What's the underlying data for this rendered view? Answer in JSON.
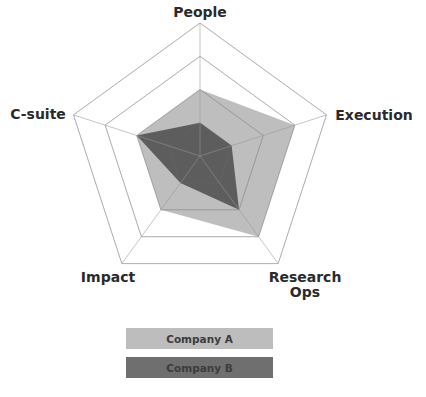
{
  "chart_data": {
    "type": "radar",
    "title": "",
    "axes": [
      "People",
      "Execution",
      "Research Ops",
      "Impact",
      "C-suite"
    ],
    "range": [
      0,
      4
    ],
    "grid_levels": [
      1,
      2,
      3,
      4
    ],
    "series": [
      {
        "name": "Company A",
        "values": [
          2,
          3,
          3,
          2,
          2
        ],
        "color": "#a9a9a9"
      },
      {
        "name": "Company B",
        "values": [
          1,
          1,
          2,
          1,
          2
        ],
        "color": "#4a4a4a"
      }
    ],
    "legend_position": "bottom"
  },
  "labels": {
    "people": "People",
    "execution": "Execution",
    "research_ops": "Research\nOps",
    "impact": "Impact",
    "csuite": "C-suite"
  },
  "legend": {
    "a": {
      "label": "Company A",
      "color": "#bdbdbd"
    },
    "b": {
      "label": "Company B",
      "color": "#6f6f6f"
    }
  }
}
